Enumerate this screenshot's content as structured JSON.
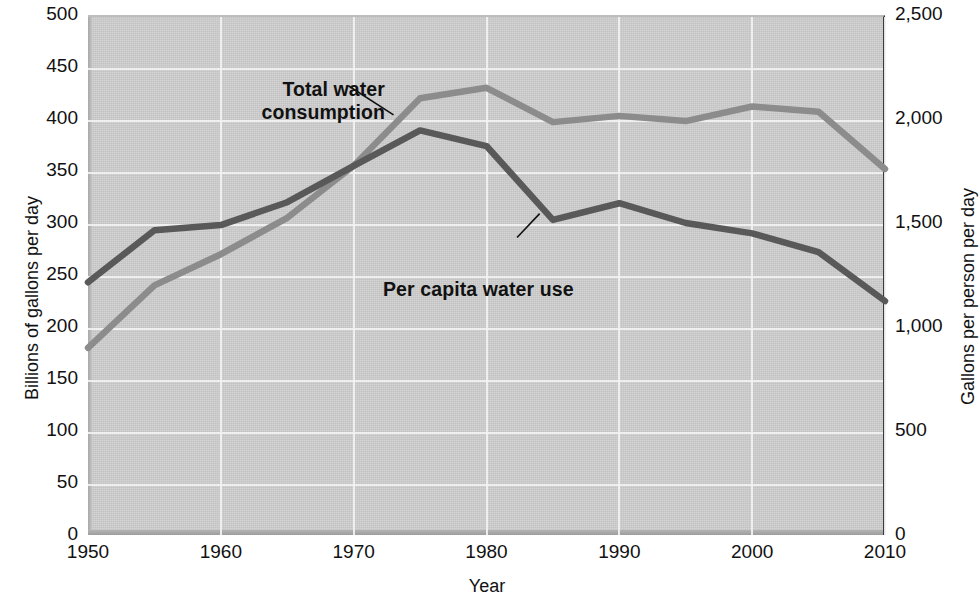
{
  "chart_data": {
    "type": "line",
    "title": "",
    "xlabel": "Year",
    "ylabel": "Billions of gallons per day",
    "y2label": "Gallons per person per day",
    "x": [
      1950,
      1955,
      1960,
      1965,
      1970,
      1975,
      1980,
      1985,
      1990,
      1995,
      2000,
      2005,
      2010
    ],
    "xlim": [
      1950,
      2010
    ],
    "ylim": [
      0,
      500
    ],
    "y2lim": [
      0,
      2500
    ],
    "grid": true,
    "legend_position": "inline-annotations",
    "xticks": [
      "1950",
      "1960",
      "1970",
      "1980",
      "1990",
      "2000",
      "2010"
    ],
    "xtick_values": [
      1950,
      1960,
      1970,
      1980,
      1990,
      2000,
      2010
    ],
    "yticks": [
      "0",
      "50",
      "100",
      "150",
      "200",
      "250",
      "300",
      "350",
      "400",
      "450",
      "500"
    ],
    "ytick_values": [
      0,
      50,
      100,
      150,
      200,
      250,
      300,
      350,
      400,
      450,
      500
    ],
    "y2ticks": [
      "0",
      "500",
      "1,000",
      "1,500",
      "2,000",
      "2,500"
    ],
    "y2tick_values": [
      0,
      500,
      1000,
      1500,
      2000,
      2500
    ],
    "series": [
      {
        "name": "Total water consumption",
        "axis": "left",
        "units": "Billions of gallons per day",
        "color": "#8c8c8c",
        "values": [
          180,
          240,
          270,
          305,
          355,
          420,
          430,
          397,
          403,
          398,
          412,
          407,
          352
        ]
      },
      {
        "name": "Per capita water use",
        "axis": "right",
        "units": "Gallons per person per day",
        "color": "#595959",
        "values": [
          1215,
          1465,
          1490,
          1600,
          1775,
          1945,
          1870,
          1515,
          1595,
          1500,
          1450,
          1360,
          1125
        ]
      }
    ],
    "annotations": [
      {
        "text": "Total water\nconsumption",
        "x": 1971,
        "y": 425,
        "anchor": "end"
      },
      {
        "text": "Per capita water use",
        "x": 1978,
        "y": 280,
        "anchor": "start"
      }
    ]
  },
  "axes": {
    "left_title": "Billions of gallons per day",
    "right_title": "Gallons per person per day",
    "x_title": "Year"
  },
  "annotations": {
    "total": {
      "line1": "Total water",
      "line2": "consumption"
    },
    "percapita": {
      "line1": "Per capita water use"
    }
  },
  "colors": {
    "plot_background": "#cfcfcf",
    "gridline": "#f2f2f2",
    "total_series": "#8c8c8c",
    "percapita_series": "#595959",
    "text": "#111111"
  }
}
